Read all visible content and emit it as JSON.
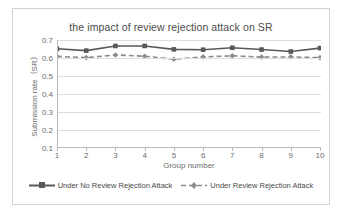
{
  "chart_data": {
    "type": "line",
    "title": "the impact of review rejection attack on SR",
    "xlabel": "Group number",
    "ylabel": "Submission rate（SR）",
    "categories": [
      1,
      2,
      3,
      4,
      5,
      6,
      7,
      8,
      9,
      10
    ],
    "x_tick_labels": [
      "1",
      "2",
      "3",
      "4",
      "5",
      "6",
      "7",
      "8",
      "9",
      "10"
    ],
    "y_tick_labels": [
      "0.1",
      "0.2",
      "0.3",
      "0.4",
      "0.5",
      "0.6",
      "0.7"
    ],
    "y_ticks": [
      0.1,
      0.2,
      0.3,
      0.4,
      0.5,
      0.6,
      0.7
    ],
    "ylim": [
      0.1,
      0.7
    ],
    "xlim": [
      1,
      10
    ],
    "grid": true,
    "legend_position": "bottom",
    "series": [
      {
        "name": "Under No Review Rejection Attack",
        "style": "solid",
        "marker": "square",
        "color": "#595959",
        "values": [
          0.651,
          0.641,
          0.667,
          0.667,
          0.648,
          0.646,
          0.657,
          0.647,
          0.636,
          0.655
        ]
      },
      {
        "name": "Under Review Rejection Attack",
        "style": "dashed",
        "marker": "diamond",
        "color": "#8c8c8c",
        "values": [
          0.609,
          0.602,
          0.617,
          0.61,
          0.593,
          0.606,
          0.612,
          0.605,
          0.606,
          0.602
        ]
      }
    ]
  },
  "legend": {
    "items": [
      {
        "label": "Under No Review Rejection Attack"
      },
      {
        "label": "Under Review Rejection Attack"
      }
    ]
  }
}
